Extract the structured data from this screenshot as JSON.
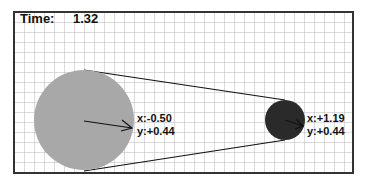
{
  "header": {
    "time_label": "Time:",
    "time_value": "1.32"
  },
  "canvas": {
    "background": "#ffffff",
    "grid_color": "#b8b8b8",
    "border_color": "#333333",
    "grid_spacing_px": 10
  },
  "bodies": [
    {
      "name": "large-body",
      "color": "#a8a8a8",
      "x_label": "x:-0.50",
      "y_label": "y:+0.44"
    },
    {
      "name": "small-body",
      "color": "#2a2a2a",
      "x_label": "x:+1.19",
      "y_label": "y:+0.44"
    }
  ]
}
